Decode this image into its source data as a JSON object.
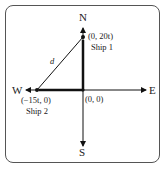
{
  "diagram": {
    "directions": {
      "north": "N",
      "south": "S",
      "east": "E",
      "west": "W"
    },
    "origin_label": "(0, 0)",
    "ship1": {
      "coord": "(0, 20t)",
      "name": "Ship 1"
    },
    "ship2": {
      "coord": "(−15t, 0)",
      "name": "Ship 2"
    },
    "distance_label": "d",
    "colors": {
      "line": "#111111",
      "border": "#555555"
    }
  }
}
